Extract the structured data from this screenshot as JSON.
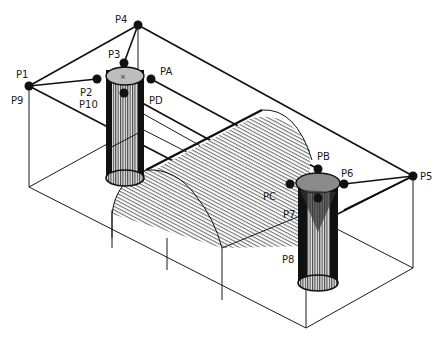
{
  "diagram": {
    "type": "isometric-wireframe",
    "colors": {
      "ink": "#111111",
      "background": "#ffffff",
      "cylinder_fill": "#555555"
    },
    "labels": {
      "p1": "P1",
      "p9": "P9",
      "p2": "P2",
      "p10": "P10",
      "p3": "P3",
      "p4": "P4",
      "pa": "PA",
      "pd": "PD",
      "p5": "P5",
      "p6": "P6",
      "pb": "PB",
      "pc": "PC",
      "p7": "P7",
      "p8": "P8"
    },
    "nodes": [
      {
        "id": "P4",
        "x": 138,
        "y": 25
      },
      {
        "id": "P1",
        "x": 29,
        "y": 86
      },
      {
        "id": "P3",
        "x": 124,
        "y": 63
      },
      {
        "id": "P2",
        "x": 97,
        "y": 79
      },
      {
        "id": "PA",
        "x": 151,
        "y": 79
      },
      {
        "id": "PD",
        "x": 124,
        "y": 93
      },
      {
        "id": "P5",
        "x": 413,
        "y": 176
      },
      {
        "id": "PB",
        "x": 318,
        "y": 169
      },
      {
        "id": "P6",
        "x": 344,
        "y": 184
      },
      {
        "id": "PC",
        "x": 290,
        "y": 184
      },
      {
        "id": "P7",
        "x": 318,
        "y": 198
      }
    ]
  }
}
